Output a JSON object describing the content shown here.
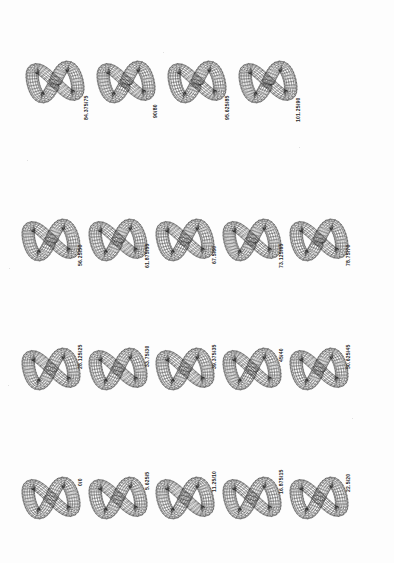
{
  "page": {
    "background_color": "#fdfdfd",
    "ink_color": "#2b2b2b"
  },
  "chart_data": {
    "type": "scatter",
    "title": "",
    "subtitle": "",
    "xlabel": "",
    "ylabel": "",
    "legend": [],
    "grid": false,
    "series": [
      {
        "name": "figure-eight torus sequence",
        "values": [
          0,
          5.625,
          11.25,
          16.875,
          22.5,
          28.125,
          33.75,
          39.375,
          45,
          50.625,
          56.25,
          61.875,
          67.5,
          73.125,
          78.75,
          84.375,
          90,
          95.625,
          101.25
        ]
      },
      {
        "name": "secondary parameter",
        "values": [
          0,
          5,
          10,
          15,
          20,
          25,
          30,
          35,
          40,
          45,
          50,
          55,
          60,
          65,
          70,
          75,
          80,
          85,
          90
        ]
      }
    ],
    "annotations": [
      "0/0",
      "5.625/5",
      "11.25/10",
      "16.875/15",
      "22.5/20",
      "28.125/25",
      "33.75/30",
      "39.375/35",
      "45/40",
      "50.625/45",
      "56.25/50",
      "61.875/55",
      "67.5/60",
      "73.125/65",
      "78.75/70",
      "84.375/75",
      "90/80",
      "95.625/85",
      "101.25/90"
    ]
  },
  "rows": [
    {
      "name": "row-1",
      "top": 18,
      "count": 4,
      "cells": [
        {
          "label": "84.375/75",
          "twist": 84.375,
          "aux": 75,
          "x": 24,
          "label_x": 84,
          "label_y": 102
        },
        {
          "label": "90/80",
          "twist": 90,
          "aux": 80,
          "x": 95,
          "label_x": 153,
          "label_y": 100
        },
        {
          "label": "95.625/85",
          "twist": 95.625,
          "aux": 85,
          "x": 166,
          "label_x": 225,
          "label_y": 102
        },
        {
          "label": "101.25/90",
          "twist": 101.25,
          "aux": 90,
          "x": 237,
          "label_x": 296,
          "label_y": 104
        }
      ]
    },
    {
      "name": "row-2",
      "top": 176,
      "count": 5,
      "cells": [
        {
          "label": "56.25/50",
          "twist": 56.25,
          "aux": 50,
          "x": 20,
          "label_x": 78,
          "label_y": 90
        },
        {
          "label": "61.875/55",
          "twist": 61.875,
          "aux": 55,
          "x": 87,
          "label_x": 145,
          "label_y": 92
        },
        {
          "label": "67.5/60",
          "twist": 67.5,
          "aux": 60,
          "x": 154,
          "label_x": 212,
          "label_y": 88
        },
        {
          "label": "73.125/65",
          "twist": 73.125,
          "aux": 65,
          "x": 221,
          "label_x": 279,
          "label_y": 92
        },
        {
          "label": "78.75/70",
          "twist": 78.75,
          "aux": 70,
          "x": 288,
          "label_x": 346,
          "label_y": 90
        }
      ]
    },
    {
      "name": "row-3",
      "top": 305,
      "count": 5,
      "cells": [
        {
          "label": "28.125/25",
          "twist": 28.125,
          "aux": 25,
          "x": 20,
          "label_x": 78,
          "label_y": 64
        },
        {
          "label": "33.75/30",
          "twist": 33.75,
          "aux": 30,
          "x": 87,
          "label_x": 145,
          "label_y": 62
        },
        {
          "label": "39.375/35",
          "twist": 39.375,
          "aux": 35,
          "x": 154,
          "label_x": 212,
          "label_y": 64
        },
        {
          "label": "45/40",
          "twist": 45,
          "aux": 40,
          "x": 221,
          "label_x": 279,
          "label_y": 57
        },
        {
          "label": "50.625/45",
          "twist": 50.625,
          "aux": 45,
          "x": 288,
          "label_x": 346,
          "label_y": 64
        }
      ]
    },
    {
      "name": "row-4",
      "top": 434,
      "count": 5,
      "cells": [
        {
          "label": "0/0",
          "twist": 0,
          "aux": 0,
          "x": 20,
          "label_x": 78,
          "label_y": 52
        },
        {
          "label": "5.625/5",
          "twist": 5.625,
          "aux": 5,
          "x": 87,
          "label_x": 145,
          "label_y": 56
        },
        {
          "label": "11.25/10",
          "twist": 11.25,
          "aux": 10,
          "x": 154,
          "label_x": 212,
          "label_y": 58
        },
        {
          "label": "16.875/15",
          "twist": 16.875,
          "aux": 15,
          "x": 221,
          "label_x": 279,
          "label_y": 60
        },
        {
          "label": "22.5/20",
          "twist": 22.5,
          "aux": 20,
          "x": 288,
          "label_x": 346,
          "label_y": 58
        }
      ]
    }
  ]
}
